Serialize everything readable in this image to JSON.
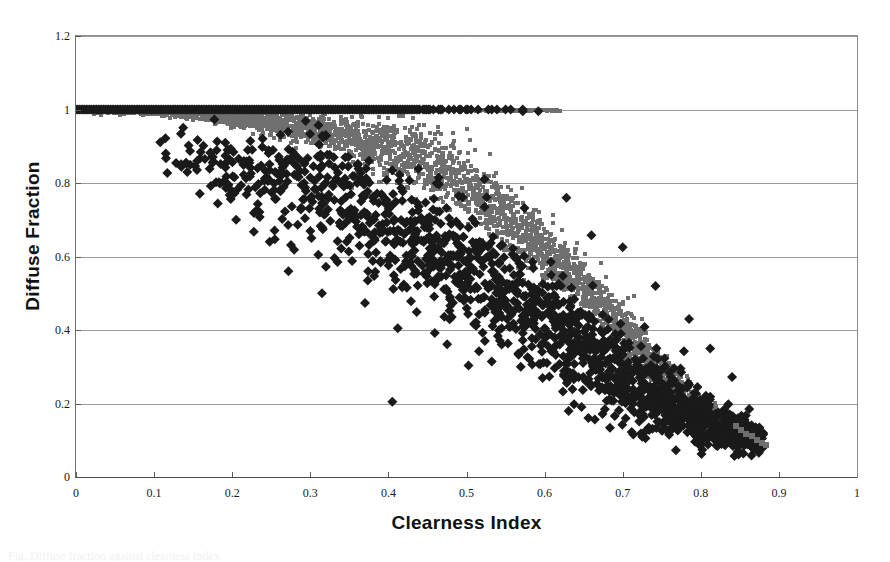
{
  "figure": {
    "background": "#ffffff",
    "caption_partial": "Fig. Diffuse fraction against clearness index"
  },
  "chart_data": {
    "type": "scatter",
    "title": "",
    "xlabel": "Clearness Index",
    "ylabel": "Diffuse Fraction",
    "xlim": [
      0,
      1
    ],
    "ylim": [
      0,
      1.2
    ],
    "xticks": [
      "0",
      "0.1",
      "0.2",
      "0.3",
      "0.4",
      "0.5",
      "0.6",
      "0.7",
      "0.8",
      "0.9",
      "1"
    ],
    "xtick_values": [
      0,
      0.1,
      0.2,
      0.3,
      0.4,
      0.5,
      0.6,
      0.7,
      0.8,
      0.9,
      1.0
    ],
    "yticks": [
      "0",
      "0.2",
      "0.4",
      "0.6",
      "0.8",
      "1",
      "1.2"
    ],
    "ytick_values": [
      0,
      0.2,
      0.4,
      0.6,
      0.8,
      1.0,
      1.2
    ],
    "grid": {
      "horizontal": true,
      "vertical": false,
      "color": "#9a9a9a"
    },
    "legend": {
      "visible": false,
      "position": "none"
    },
    "point_count_total": 4200,
    "series": [
      {
        "name": "modelled",
        "marker": "square",
        "marker_size": 4,
        "color": "#6f6f6f",
        "n_points": 2600,
        "description": "Dense continuous band: saturates at diffuse fraction 1.0 for clearness index below about 0.45, then falls steeply and linearly to about 0.10 at clearness index 0.85, with a narrow vertical spread of roughly 0.06.",
        "curve_anchors": [
          {
            "x": 0.0,
            "y": 1.0,
            "spread": 0.01
          },
          {
            "x": 0.1,
            "y": 0.995,
            "spread": 0.015
          },
          {
            "x": 0.2,
            "y": 0.98,
            "spread": 0.035
          },
          {
            "x": 0.3,
            "y": 0.95,
            "spread": 0.07
          },
          {
            "x": 0.4,
            "y": 0.9,
            "spread": 0.11
          },
          {
            "x": 0.45,
            "y": 0.855,
            "spread": 0.125
          },
          {
            "x": 0.5,
            "y": 0.79,
            "spread": 0.13
          },
          {
            "x": 0.55,
            "y": 0.71,
            "spread": 0.125
          },
          {
            "x": 0.6,
            "y": 0.62,
            "spread": 0.115
          },
          {
            "x": 0.65,
            "y": 0.52,
            "spread": 0.105
          },
          {
            "x": 0.7,
            "y": 0.4,
            "spread": 0.095
          },
          {
            "x": 0.75,
            "y": 0.29,
            "spread": 0.08
          },
          {
            "x": 0.8,
            "y": 0.18,
            "spread": 0.06
          },
          {
            "x": 0.85,
            "y": 0.115,
            "spread": 0.04
          },
          {
            "x": 0.88,
            "y": 0.095,
            "spread": 0.03
          }
        ]
      },
      {
        "name": "measured",
        "marker": "diamond",
        "marker_size": 5,
        "color": "#1a1a1a",
        "n_points": 1600,
        "description": "Scattered black diamonds forming a broad falling cloud. A horizontal ceiling of points sits exactly at diffuse fraction 1.0 for clearness index up to about 0.59. Below that the cloud scatters widely, from about 0.88 diffuse fraction at clearness index 0.12 down to about 0.08 near clearness index 0.86, with wide vertical dispersion of plus or minus 0.15.",
        "ceiling": {
          "y": 1.0,
          "x_max": 0.59
        },
        "curve_anchors": [
          {
            "x": 0.1,
            "y": 0.89,
            "spread": 0.04
          },
          {
            "x": 0.15,
            "y": 0.87,
            "spread": 0.075
          },
          {
            "x": 0.2,
            "y": 0.84,
            "spread": 0.11
          },
          {
            "x": 0.25,
            "y": 0.81,
            "spread": 0.14
          },
          {
            "x": 0.3,
            "y": 0.775,
            "spread": 0.16
          },
          {
            "x": 0.35,
            "y": 0.73,
            "spread": 0.17
          },
          {
            "x": 0.4,
            "y": 0.68,
            "spread": 0.175
          },
          {
            "x": 0.45,
            "y": 0.63,
            "spread": 0.175
          },
          {
            "x": 0.5,
            "y": 0.57,
            "spread": 0.175
          },
          {
            "x": 0.55,
            "y": 0.5,
            "spread": 0.17
          },
          {
            "x": 0.6,
            "y": 0.43,
            "spread": 0.165
          },
          {
            "x": 0.65,
            "y": 0.35,
            "spread": 0.15
          },
          {
            "x": 0.7,
            "y": 0.28,
            "spread": 0.135
          },
          {
            "x": 0.75,
            "y": 0.21,
            "spread": 0.11
          },
          {
            "x": 0.8,
            "y": 0.15,
            "spread": 0.08
          },
          {
            "x": 0.85,
            "y": 0.115,
            "spread": 0.055
          },
          {
            "x": 0.88,
            "y": 0.105,
            "spread": 0.04
          }
        ],
        "outliers": [
          {
            "x": 0.115,
            "y": 0.88
          },
          {
            "x": 0.155,
            "y": 0.86
          },
          {
            "x": 0.165,
            "y": 0.865
          },
          {
            "x": 0.175,
            "y": 0.855
          },
          {
            "x": 0.195,
            "y": 0.795
          },
          {
            "x": 0.215,
            "y": 0.86
          },
          {
            "x": 0.222,
            "y": 0.855
          },
          {
            "x": 0.205,
            "y": 0.7
          },
          {
            "x": 0.248,
            "y": 0.64
          },
          {
            "x": 0.255,
            "y": 0.83
          },
          {
            "x": 0.283,
            "y": 0.845
          },
          {
            "x": 0.292,
            "y": 0.8
          },
          {
            "x": 0.3,
            "y": 0.815
          },
          {
            "x": 0.272,
            "y": 0.56
          },
          {
            "x": 0.315,
            "y": 0.5
          },
          {
            "x": 0.33,
            "y": 0.87
          },
          {
            "x": 0.36,
            "y": 0.8
          },
          {
            "x": 0.374,
            "y": 0.56
          },
          {
            "x": 0.405,
            "y": 0.205
          },
          {
            "x": 0.412,
            "y": 0.405
          },
          {
            "x": 0.428,
            "y": 0.605
          },
          {
            "x": 0.455,
            "y": 0.64
          },
          {
            "x": 0.487,
            "y": 0.6
          },
          {
            "x": 0.523,
            "y": 0.81
          },
          {
            "x": 0.545,
            "y": 0.405
          },
          {
            "x": 0.572,
            "y": 0.995
          },
          {
            "x": 0.592,
            "y": 0.995
          },
          {
            "x": 0.628,
            "y": 0.76
          },
          {
            "x": 0.66,
            "y": 0.658
          },
          {
            "x": 0.7,
            "y": 0.625
          },
          {
            "x": 0.742,
            "y": 0.52
          },
          {
            "x": 0.785,
            "y": 0.43
          },
          {
            "x": 0.812,
            "y": 0.35
          },
          {
            "x": 0.84,
            "y": 0.272
          },
          {
            "x": 0.862,
            "y": 0.185
          },
          {
            "x": 0.875,
            "y": 0.135
          },
          {
            "x": 0.88,
            "y": 0.12
          }
        ]
      }
    ]
  }
}
